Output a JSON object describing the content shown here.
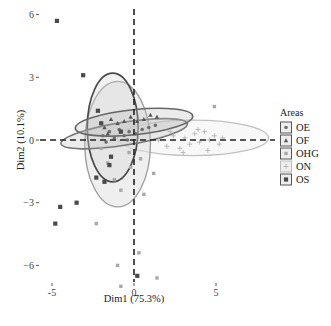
{
  "chart_data": {
    "type": "scatter",
    "title": "",
    "xlabel": "Dim1 (75.3%)",
    "ylabel": "Dim2 (10.1%)",
    "xlim": [
      -5.1,
      8.0
    ],
    "ylim": [
      -6.9,
      6.3
    ],
    "x_ticks": [
      -5,
      0,
      5
    ],
    "y_ticks": [
      -6,
      -3,
      0,
      3,
      6
    ],
    "x_tick_labels": [
      "-5",
      "0",
      "5"
    ],
    "y_tick_labels": [
      "−6",
      "−3",
      "0",
      "3",
      "6"
    ],
    "grid": false,
    "reference_lines": {
      "x": 0,
      "y": 0,
      "style": "dashed"
    },
    "legend": {
      "title": "Areas",
      "position": "right",
      "entries": [
        "OE",
        "OF",
        "OHG",
        "ON",
        "OS"
      ]
    },
    "series": [
      {
        "name": "OE",
        "marker": "circle",
        "color": "#6e6e6e",
        "points": [
          [
            -1.9,
            0.2
          ],
          [
            -1.5,
            0.4
          ],
          [
            -1.2,
            0.1
          ],
          [
            -0.9,
            0.5
          ],
          [
            -0.6,
            0.2
          ],
          [
            -0.3,
            0.4
          ],
          [
            0.1,
            0.3
          ],
          [
            0.5,
            0.5
          ],
          [
            0.9,
            0.6
          ],
          [
            1.3,
            0.7
          ],
          [
            -1.7,
            -0.1
          ],
          [
            -0.4,
            0.0
          ]
        ],
        "ellipse": {
          "cx": -0.6,
          "cy": 0.3,
          "rx": 3.9,
          "ry": 0.55,
          "angle_deg": -9
        }
      },
      {
        "name": "OF",
        "marker": "triangle",
        "color": "#555555",
        "points": [
          [
            -1.8,
            0.6
          ],
          [
            -1.4,
            1.0
          ],
          [
            -1.0,
            0.8
          ],
          [
            -0.6,
            0.9
          ],
          [
            -0.2,
            1.1
          ],
          [
            0.2,
            0.9
          ],
          [
            0.6,
            1.0
          ],
          [
            1.0,
            1.2
          ],
          [
            1.4,
            1.1
          ],
          [
            -1.6,
            0.3
          ]
        ],
        "ellipse": {
          "cx": 0.0,
          "cy": 0.85,
          "rx": 3.6,
          "ry": 0.6,
          "angle_deg": -6
        }
      },
      {
        "name": "OHG",
        "marker": "square",
        "color": "#a8a8a8",
        "points": [
          [
            -2.0,
            -0.4
          ],
          [
            -1.6,
            -1.1
          ],
          [
            -1.2,
            -1.9
          ],
          [
            -0.8,
            -2.4
          ],
          [
            -0.3,
            -0.6
          ],
          [
            0.4,
            -0.9
          ],
          [
            1.2,
            -1.6
          ],
          [
            -2.3,
            -4.0
          ],
          [
            -0.8,
            -7.0
          ],
          [
            1.4,
            -6.6
          ],
          [
            0.3,
            -5.4
          ],
          [
            0.6,
            -2.6
          ],
          [
            -1.0,
            -6.0
          ],
          [
            4.9,
            1.6
          ],
          [
            -0.2,
            -1.3
          ]
        ],
        "ellipse": {
          "cx": -1.0,
          "cy": -0.2,
          "rx": 2.0,
          "ry": 3.0,
          "angle_deg": 0
        }
      },
      {
        "name": "ON",
        "marker": "cross",
        "color": "#b4b4b4",
        "points": [
          [
            1.5,
            0.0
          ],
          [
            2.0,
            -0.3
          ],
          [
            2.4,
            0.2
          ],
          [
            2.8,
            -0.4
          ],
          [
            3.1,
            0.1
          ],
          [
            3.4,
            -0.2
          ],
          [
            3.7,
            0.3
          ],
          [
            4.0,
            -0.1
          ],
          [
            4.3,
            0.4
          ],
          [
            4.6,
            0.0
          ],
          [
            4.9,
            0.2
          ],
          [
            5.2,
            -0.2
          ],
          [
            2.2,
            0.4
          ],
          [
            3.0,
            -0.6
          ],
          [
            3.9,
            0.5
          ],
          [
            4.5,
            -0.5
          ],
          [
            5.4,
            0.1
          ]
        ],
        "ellipse": {
          "cx": 3.6,
          "cy": 0.1,
          "rx": 4.6,
          "ry": 0.85,
          "angle_deg": 0
        }
      },
      {
        "name": "OS",
        "marker": "square-filled",
        "color": "#4a4a4a",
        "points": [
          [
            -4.7,
            5.7
          ],
          [
            -3.1,
            3.1
          ],
          [
            -2.2,
            1.4
          ],
          [
            -2.0,
            0.8
          ],
          [
            -1.5,
            -1.2
          ],
          [
            -1.8,
            -2.0
          ],
          [
            -2.3,
            -1.8
          ],
          [
            -3.5,
            -3.0
          ],
          [
            -4.5,
            -3.2
          ],
          [
            -4.8,
            -4.0
          ],
          [
            0.2,
            -6.5
          ],
          [
            -1.4,
            -0.8
          ],
          [
            -0.8,
            0.4
          ]
        ],
        "ellipse": {
          "cx": -1.3,
          "cy": 0.6,
          "rx": 1.55,
          "ry": 2.6,
          "angle_deg": 0
        }
      }
    ]
  }
}
